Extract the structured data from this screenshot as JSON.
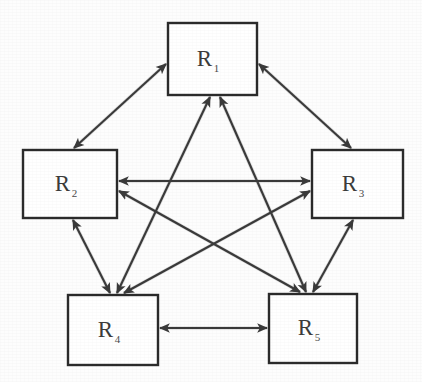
{
  "diagram": {
    "type": "directed-graph-complete",
    "background_color": "#fdfdfd",
    "line_color": "#3a3a3a",
    "node_fill_color": "#ffffff",
    "node_stroke_color": "#2b2b2b",
    "label_color": "#3b3b3b",
    "nodes": [
      {
        "id": "R1",
        "base": "R",
        "subscript": "1",
        "label": "R1",
        "x": 168,
        "y": 23,
        "width": 89,
        "height": 72,
        "center_x": 212,
        "center_y": 59,
        "position": "top-center"
      },
      {
        "id": "R2",
        "base": "R",
        "subscript": "2",
        "label": "R2",
        "x": 23,
        "y": 150,
        "width": 94,
        "height": 68,
        "center_x": 70,
        "center_y": 184,
        "position": "middle-left"
      },
      {
        "id": "R3",
        "base": "R",
        "subscript": "3",
        "label": "R3",
        "x": 312,
        "y": 150,
        "width": 91,
        "height": 68,
        "center_x": 357,
        "center_y": 184,
        "position": "middle-right"
      },
      {
        "id": "R4",
        "base": "R",
        "subscript": "4",
        "label": "R4",
        "x": 68,
        "y": 295,
        "width": 90,
        "height": 70,
        "center_x": 113,
        "center_y": 330,
        "position": "bottom-left"
      },
      {
        "id": "R5",
        "base": "R",
        "subscript": "5",
        "label": "R5",
        "x": 269,
        "y": 294,
        "width": 88,
        "height": 69,
        "center_x": 313,
        "center_y": 328,
        "position": "bottom-right"
      }
    ],
    "edges": [
      {
        "id": "edge-r1-r2",
        "from": "R1",
        "to": "R2",
        "direction": "bidirectional",
        "x1": 166,
        "y1": 64,
        "x2": 74,
        "y2": 148,
        "label": "R1 to R2"
      },
      {
        "id": "edge-r1-r3",
        "from": "R1",
        "to": "R3",
        "direction": "bidirectional",
        "x1": 259,
        "y1": 64,
        "x2": 351,
        "y2": 148,
        "label": "R1 to R3"
      },
      {
        "id": "edge-r1-r4",
        "from": "R1",
        "to": "R4",
        "direction": "bidirectional",
        "x1": 210,
        "y1": 97,
        "x2": 117,
        "y2": 293,
        "label": "R1 to R4"
      },
      {
        "id": "edge-r1-r5",
        "from": "R1",
        "to": "R5",
        "direction": "bidirectional",
        "x1": 220,
        "y1": 97,
        "x2": 306,
        "y2": 292,
        "label": "R1 to R5"
      },
      {
        "id": "edge-r2-r3",
        "from": "R2",
        "to": "R3",
        "direction": "bidirectional",
        "x1": 119,
        "y1": 181,
        "x2": 310,
        "y2": 181,
        "label": "R2 to R3"
      },
      {
        "id": "edge-r2-r4",
        "from": "R2",
        "to": "R4",
        "direction": "bidirectional",
        "x1": 73,
        "y1": 220,
        "x2": 110,
        "y2": 293,
        "label": "R2 to R4"
      },
      {
        "id": "edge-r2-r5",
        "from": "R2",
        "to": "R5",
        "direction": "bidirectional",
        "x1": 119,
        "y1": 191,
        "x2": 300,
        "y2": 292,
        "label": "R2 to R5"
      },
      {
        "id": "edge-r3-r4",
        "from": "R3",
        "to": "R4",
        "direction": "bidirectional",
        "x1": 310,
        "y1": 191,
        "x2": 124,
        "y2": 293,
        "label": "R3 to R4"
      },
      {
        "id": "edge-r3-r5",
        "from": "R3",
        "to": "R5",
        "direction": "bidirectional",
        "x1": 353,
        "y1": 220,
        "x2": 313,
        "y2": 292,
        "label": "R3 to R5"
      },
      {
        "id": "edge-r4-r5",
        "from": "R4",
        "to": "R5",
        "direction": "bidirectional",
        "x1": 160,
        "y1": 328,
        "x2": 267,
        "y2": 328,
        "label": "R4 to R5"
      }
    ],
    "edge_count": 10,
    "node_count": 5
  }
}
